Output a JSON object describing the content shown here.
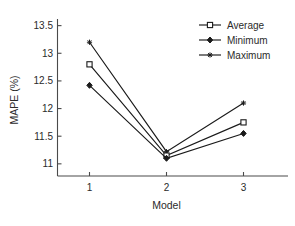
{
  "chart_data": {
    "type": "line",
    "title": "",
    "xlabel": "Model",
    "ylabel": "MAPE (%)",
    "categories": [
      "1",
      "2",
      "3"
    ],
    "x": [
      1,
      2,
      3
    ],
    "xlim": [
      0.55,
      3.45
    ],
    "xticks": [
      "1",
      "2",
      "3"
    ],
    "ylim": [
      10.78,
      13.62
    ],
    "yticks": [
      "11",
      "11.5",
      "12",
      "12.5",
      "13",
      "13.5"
    ],
    "ytick_values": [
      11,
      11.5,
      12,
      12.5,
      13,
      13.5
    ],
    "grid": false,
    "legend_position": "top-right",
    "legend_border": false,
    "series": [
      {
        "name": "Average",
        "marker": "square",
        "values": [
          12.8,
          11.15,
          11.75
        ],
        "color": "#1a1a1a"
      },
      {
        "name": "Minimum",
        "marker": "diamond",
        "values": [
          12.42,
          11.1,
          11.55
        ],
        "color": "#1a1a1a"
      },
      {
        "name": "Maximum",
        "marker": "star",
        "values": [
          13.2,
          11.22,
          12.1
        ],
        "color": "#1a1a1a"
      }
    ]
  },
  "axes": {
    "y_title": "MAPE (%)",
    "x_title": "Model",
    "y_tick_labels": [
      "13.5",
      "13",
      "12.5",
      "12",
      "11.5",
      "11"
    ],
    "x_tick_labels": [
      "1",
      "2",
      "3"
    ]
  },
  "legend": {
    "entries": [
      {
        "label": "Average",
        "marker": "square-marker"
      },
      {
        "label": "Minimum",
        "marker": "diamond-marker"
      },
      {
        "label": "Maximum",
        "marker": "star-marker"
      }
    ]
  },
  "colors": {
    "line": "#1a1a1a",
    "axis": "#4a4a4a",
    "text": "#2b2b2b",
    "background": "#ffffff"
  },
  "caption_fragment": ""
}
